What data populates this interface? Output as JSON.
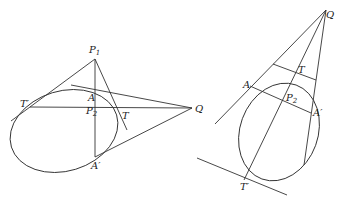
{
  "figures": [
    {
      "id": "left",
      "labels": {
        "P1": "P",
        "P1_sub": "1",
        "A": "A",
        "T_prime": "T′",
        "P2": "P",
        "P2_sub": "2",
        "T": "T",
        "Q": "Q",
        "A_prime": "A′"
      }
    },
    {
      "id": "right",
      "labels": {
        "Q": "Q",
        "T": "T",
        "A": "A",
        "P2": "P",
        "P2_sub": "2",
        "A_prime": "A′",
        "T_prime": "T′"
      }
    }
  ],
  "colors": {
    "stroke": "#333333",
    "text": "#222222",
    "background": "#ffffff"
  }
}
